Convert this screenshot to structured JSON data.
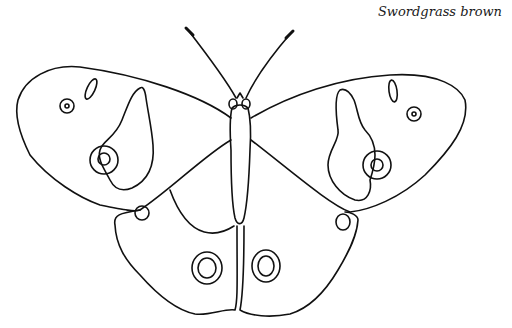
{
  "caption": "Swordgrass brown",
  "colors": {
    "line": "#111111",
    "background": "#ffffff"
  }
}
